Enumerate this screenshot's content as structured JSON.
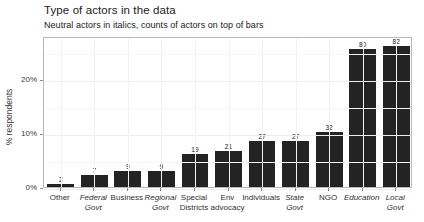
{
  "chart_data": {
    "type": "bar",
    "title": "Type of actors in the data",
    "subtitle": "Neutral actors in italics, counts of actors on top of bars",
    "xlabel": "",
    "ylabel": "% respondents",
    "categories": [
      "Other",
      "Federal\nGovt",
      "Business",
      "Regional\nGovt",
      "Special\nDistricts",
      "Env\nadvocacy",
      "Individuals",
      "State\nGovt",
      "NGO",
      "Education",
      "Local\nGovt"
    ],
    "counts": [
      2,
      7,
      9,
      9,
      19,
      21,
      27,
      27,
      32,
      80,
      82
    ],
    "values": [
      0.6,
      2.2,
      2.9,
      2.9,
      6.1,
      6.7,
      8.6,
      8.6,
      10.2,
      25.5,
      26.1
    ],
    "italic_flags": [
      false,
      true,
      false,
      true,
      false,
      false,
      false,
      true,
      false,
      true,
      true
    ],
    "ylim": [
      0,
      28
    ],
    "yticks": [
      0,
      10,
      20
    ],
    "ytick_labels": [
      "0%",
      "10%",
      "20%"
    ],
    "grid": true,
    "legend": "none",
    "bar_color": "#232323",
    "panel_border_color": "#b9b9b9"
  }
}
